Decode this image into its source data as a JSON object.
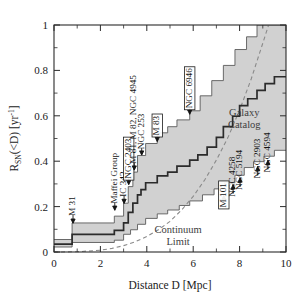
{
  "chart_data": {
    "type": "line",
    "title": "",
    "xlabel": "Distance D [Mpc]",
    "ylabel": "R_SN(<D) [yr^-1]",
    "ylabel_parts": {
      "main": "R",
      "sub": "SN",
      "mid": "(<D) [yr",
      "sup": "-1",
      "end": "]"
    },
    "xlim": [
      0,
      10
    ],
    "ylim": [
      0,
      1
    ],
    "xticks": [
      0,
      2,
      4,
      6,
      8,
      10
    ],
    "xticklabels": [
      "0",
      "2",
      "4",
      "6",
      "8",
      "10"
    ],
    "xminor": [
      1,
      3,
      5,
      7,
      9
    ],
    "yticks": [
      0,
      0.2,
      0.4,
      0.6,
      0.8,
      1
    ],
    "yticklabels": [
      "0",
      "0.2",
      "0.4",
      "0.6",
      "0.8",
      "1"
    ],
    "yminor": [
      0.1,
      0.3,
      0.5,
      0.7,
      0.9
    ],
    "grid": false,
    "legend_position": "none",
    "series": [
      {
        "name": "Galaxy Catalog",
        "style": "step-solid",
        "x": [
          0.0,
          0.78,
          0.78,
          2.6,
          2.6,
          3.0,
          3.0,
          3.2,
          3.2,
          3.4,
          3.4,
          3.6,
          3.6,
          3.75,
          3.75,
          3.95,
          3.95,
          4.45,
          4.45,
          4.9,
          4.9,
          5.3,
          5.3,
          5.85,
          5.85,
          6.2,
          6.2,
          6.6,
          6.6,
          7.0,
          7.0,
          7.3,
          7.3,
          7.7,
          7.7,
          8.0,
          8.0,
          8.35,
          8.35,
          8.75,
          8.75,
          9.1,
          9.1,
          9.5,
          9.5,
          10.0
        ],
        "y": [
          0.035,
          0.035,
          0.078,
          0.078,
          0.095,
          0.095,
          0.128,
          0.128,
          0.175,
          0.175,
          0.215,
          0.215,
          0.252,
          0.252,
          0.275,
          0.275,
          0.305,
          0.305,
          0.335,
          0.335,
          0.352,
          0.352,
          0.378,
          0.378,
          0.405,
          0.405,
          0.428,
          0.428,
          0.462,
          0.462,
          0.505,
          0.505,
          0.552,
          0.552,
          0.598,
          0.598,
          0.645,
          0.645,
          0.675,
          0.675,
          0.712,
          0.712,
          0.742,
          0.742,
          0.772,
          0.772
        ]
      },
      {
        "name": "upper-bound",
        "style": "step-band-upper",
        "x": [
          0.0,
          0.78,
          0.78,
          2.6,
          2.6,
          3.0,
          3.0,
          3.2,
          3.2,
          3.4,
          3.4,
          3.6,
          3.6,
          3.95,
          3.95,
          4.45,
          4.45,
          4.9,
          4.9,
          5.3,
          5.3,
          5.85,
          5.85,
          6.3,
          6.3,
          6.8,
          6.8,
          7.3,
          7.3,
          7.8,
          7.8,
          8.3,
          8.3,
          8.75,
          8.75,
          9.05,
          9.05,
          10.0
        ],
        "y": [
          0.055,
          0.055,
          0.128,
          0.128,
          0.158,
          0.158,
          0.215,
          0.215,
          0.288,
          0.288,
          0.352,
          0.352,
          0.425,
          0.425,
          0.478,
          0.478,
          0.525,
          0.525,
          0.552,
          0.552,
          0.582,
          0.582,
          0.622,
          0.622,
          0.688,
          0.688,
          0.755,
          0.755,
          0.822,
          0.822,
          0.892,
          0.892,
          0.948,
          0.948,
          1.0,
          1.0,
          1.0,
          1.0
        ]
      },
      {
        "name": "lower-bound",
        "style": "step-band-lower",
        "x": [
          0.0,
          0.78,
          0.78,
          2.6,
          2.6,
          3.0,
          3.0,
          3.3,
          3.3,
          3.6,
          3.6,
          3.95,
          3.95,
          4.45,
          4.45,
          4.9,
          4.9,
          5.4,
          5.4,
          5.85,
          5.85,
          6.4,
          6.4,
          6.9,
          6.9,
          7.35,
          7.35,
          7.8,
          7.8,
          8.2,
          8.2,
          8.6,
          8.6,
          9.05,
          9.05,
          9.5,
          9.5,
          10.0
        ],
        "y": [
          0.022,
          0.022,
          0.042,
          0.042,
          0.052,
          0.052,
          0.078,
          0.078,
          0.098,
          0.098,
          0.122,
          0.122,
          0.148,
          0.148,
          0.168,
          0.168,
          0.185,
          0.185,
          0.205,
          0.205,
          0.225,
          0.225,
          0.252,
          0.252,
          0.278,
          0.278,
          0.305,
          0.305,
          0.338,
          0.338,
          0.372,
          0.372,
          0.398,
          0.398,
          0.422,
          0.422,
          0.448,
          0.448
        ]
      },
      {
        "name": "Continuum Limit",
        "style": "dashed-smooth",
        "x": [
          0.0,
          1.0,
          2.0,
          2.5,
          3.0,
          3.5,
          4.0,
          4.5,
          5.0,
          5.5,
          6.0,
          6.5,
          7.0,
          7.5,
          8.0,
          8.5,
          9.0,
          9.25
        ],
        "y": [
          0.0,
          0.001,
          0.008,
          0.016,
          0.028,
          0.045,
          0.068,
          0.098,
          0.135,
          0.185,
          0.245,
          0.318,
          0.405,
          0.505,
          0.625,
          0.762,
          0.92,
          1.0
        ]
      }
    ],
    "annotations": [
      {
        "id": "m31",
        "text": "M 31",
        "x": 0.82,
        "boxed": false,
        "arrow_to_y": 0.118,
        "label_bottom_y": 0.168,
        "rotated": true
      },
      {
        "id": "maffei-group",
        "text": "Maffei Group",
        "x": 2.62,
        "boxed": false,
        "arrow_to_y": 0.175,
        "label_bottom_y": 0.222,
        "rotated": true
      },
      {
        "id": "ic342",
        "text": "IC 342,",
        "x": 3.02,
        "boxed": false,
        "arrow_to_y": 0.205,
        "label_bottom_y": 0.252,
        "rotated": true
      },
      {
        "id": "ngc2403",
        "text": "NGC 2403",
        "x": 3.22,
        "boxed": true,
        "arrow_to_y": 0.288,
        "label_bottom_y": 0.332,
        "rotated": true
      },
      {
        "id": "m81-m82-ngc4945",
        "text": "M 81, M 82, NGC 4945",
        "x": 3.46,
        "boxed": false,
        "arrow_to_y": 0.352,
        "label_bottom_y": 0.398,
        "rotated": true
      },
      {
        "id": "ngc253",
        "text": "NGC 253",
        "x": 3.78,
        "boxed": false,
        "arrow_to_y": 0.418,
        "label_bottom_y": 0.462,
        "rotated": true
      },
      {
        "id": "m83",
        "text": "M 83",
        "x": 4.45,
        "boxed": true,
        "arrow_to_y": 0.478,
        "label_bottom_y": 0.522,
        "rotated": true
      },
      {
        "id": "ngc6946",
        "text": "NGC 6946",
        "x": 5.85,
        "boxed": true,
        "arrow_to_y": 0.598,
        "label_bottom_y": 0.642,
        "rotated": true
      },
      {
        "id": "m101",
        "text": "M 101",
        "x": 7.32,
        "boxed": true,
        "arrow_to_y": 0.258,
        "label_bottom_y": 0.048,
        "rotated": true,
        "below": true
      },
      {
        "id": "ngc4258",
        "text": "NGC 4258",
        "x": 7.72,
        "boxed": false,
        "arrow_to_y": 0.305,
        "label_bottom_y": 0.048,
        "rotated": true,
        "below": true
      },
      {
        "id": "ngc5194",
        "text": "NGC 5194",
        "x": 8.02,
        "boxed": false,
        "arrow_to_y": 0.335,
        "label_bottom_y": 0.062,
        "rotated": true,
        "below": true
      },
      {
        "id": "ngc2903",
        "text": "NGC 2903",
        "x": 8.78,
        "boxed": false,
        "arrow_to_y": 0.385,
        "label_bottom_y": 0.105,
        "rotated": true,
        "below": true
      },
      {
        "id": "ngc4594",
        "text": "NGC 4594",
        "x": 9.22,
        "boxed": false,
        "arrow_to_y": 0.412,
        "label_bottom_y": 0.105,
        "rotated": true,
        "below": true
      }
    ],
    "text_labels": [
      {
        "id": "galaxy-catalog",
        "line1": "Galaxy",
        "line2": "Catalog",
        "x": 8.2,
        "y": 0.6
      },
      {
        "id": "continuum-limit",
        "line1": "Continuum",
        "line2": "Limit",
        "x": 5.35,
        "y": 0.085
      }
    ]
  }
}
